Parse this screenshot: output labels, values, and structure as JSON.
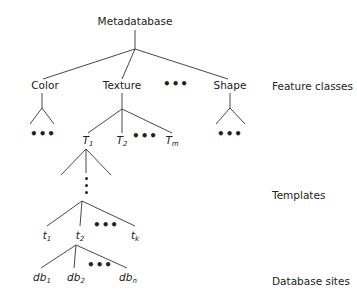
{
  "root": {
    "label": "Metadatabase"
  },
  "feature_classes": {
    "side_label": "Feature classes",
    "items": [
      {
        "label": "Color"
      },
      {
        "label": "Texture"
      },
      {
        "label": "Shape"
      }
    ],
    "ellipsis": "•••"
  },
  "templates": {
    "side_label": "Templates",
    "texture_children": [
      {
        "base": "T",
        "sub": "1"
      },
      {
        "base": "T",
        "sub": "2"
      },
      {
        "base": "T",
        "sub": "m"
      }
    ],
    "leaf_templates": [
      {
        "base": "t",
        "sub": "1"
      },
      {
        "base": "t",
        "sub": "2"
      },
      {
        "base": "t",
        "sub": "k"
      }
    ],
    "ellipsis": "•••"
  },
  "database_sites": {
    "side_label": "Database sites",
    "items": [
      {
        "base": "db",
        "sub": "1"
      },
      {
        "base": "db",
        "sub": "2"
      },
      {
        "base": "db",
        "sub": "n"
      }
    ],
    "ellipsis": "•••"
  },
  "colors": {
    "line": "#333333",
    "text": "#222222",
    "background": "#ffffff"
  }
}
